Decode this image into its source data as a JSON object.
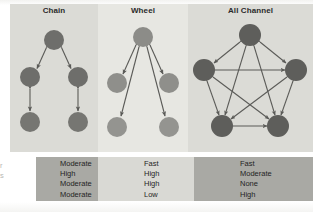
{
  "figure": {
    "panels": [
      {
        "id": "chain",
        "title": "Chain",
        "nodes": [
          {
            "id": "n1",
            "cx": 44,
            "cy": 36,
            "r": 10
          },
          {
            "id": "n2",
            "cx": 20,
            "cy": 73,
            "r": 10
          },
          {
            "id": "n3",
            "cx": 68,
            "cy": 73,
            "r": 10
          },
          {
            "id": "n4",
            "cx": 20,
            "cy": 118,
            "r": 10
          },
          {
            "id": "n5",
            "cx": 68,
            "cy": 118,
            "r": 10
          }
        ],
        "edges": [
          {
            "from": "n1",
            "to": "n2"
          },
          {
            "from": "n1",
            "to": "n3"
          },
          {
            "from": "n2",
            "to": "n4"
          },
          {
            "from": "n3",
            "to": "n5"
          }
        ]
      },
      {
        "id": "wheel",
        "title": "Wheel",
        "nodes": [
          {
            "id": "n1",
            "cx": 45,
            "cy": 33,
            "r": 10
          },
          {
            "id": "n2",
            "cx": 19,
            "cy": 79,
            "r": 10
          },
          {
            "id": "n3",
            "cx": 71,
            "cy": 79,
            "r": 10
          },
          {
            "id": "n4",
            "cx": 19,
            "cy": 123,
            "r": 10
          },
          {
            "id": "n5",
            "cx": 71,
            "cy": 123,
            "r": 10
          }
        ],
        "edges": [
          {
            "from": "n1",
            "to": "n2"
          },
          {
            "from": "n1",
            "to": "n3"
          },
          {
            "from": "n1",
            "to": "n4"
          },
          {
            "from": "n1",
            "to": "n5"
          }
        ]
      },
      {
        "id": "all-channel",
        "title": "All Channel",
        "nodes": [
          {
            "id": "n1",
            "cx": 62,
            "cy": 31,
            "r": 11
          },
          {
            "id": "n2",
            "cx": 16,
            "cy": 66,
            "r": 11
          },
          {
            "id": "n3",
            "cx": 108,
            "cy": 66,
            "r": 11
          },
          {
            "id": "n4",
            "cx": 34,
            "cy": 122,
            "r": 11
          },
          {
            "id": "n5",
            "cx": 90,
            "cy": 122,
            "r": 11
          }
        ],
        "edges": [
          {
            "from": "n1",
            "to": "n2"
          },
          {
            "from": "n1",
            "to": "n3"
          },
          {
            "from": "n1",
            "to": "n4"
          },
          {
            "from": "n1",
            "to": "n5"
          },
          {
            "from": "n2",
            "to": "n3"
          },
          {
            "from": "n2",
            "to": "n4"
          },
          {
            "from": "n2",
            "to": "n5"
          },
          {
            "from": "n3",
            "to": "n4"
          },
          {
            "from": "n3",
            "to": "n5"
          },
          {
            "from": "n4",
            "to": "n5"
          }
        ]
      }
    ],
    "criteria_table": {
      "columns": [
        {
          "network": "Chain",
          "values": [
            "Moderate",
            "High",
            "Moderate",
            "Moderate"
          ]
        },
        {
          "network": "Wheel",
          "values": [
            "Fast",
            "High",
            "High",
            "Low"
          ]
        },
        {
          "network": "All Channel",
          "values": [
            "Fast",
            "Moderate",
            "None",
            "High"
          ]
        }
      ],
      "row_label_stub": [
        "",
        "",
        "r",
        "s"
      ]
    },
    "colors": {
      "node_fill": "#6e6e6b",
      "node_fill_light": "#8c8c88",
      "arrow": "#5a5a57",
      "panel_bg_dark": "#dbdbd6",
      "panel_bg_light": "#e7e7e2",
      "table_band_dark": "#a9a9a4",
      "table_band_light": "#d9d9d4",
      "text": "#1f1f1f"
    }
  }
}
